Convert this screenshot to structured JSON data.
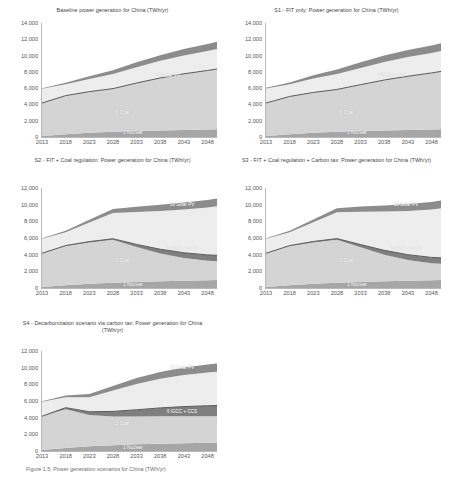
{
  "figure": {
    "caption": "Figure 1.5: Power generation scenarios for China (TWh/yr)",
    "axis": {
      "x_ticks": [
        "2013",
        "2018",
        "2023",
        "2028",
        "2033",
        "2038",
        "2043",
        "2048"
      ],
      "y_ticks_tall": [
        "0",
        "2,000",
        "4,000",
        "6,000",
        "8,000",
        "10,000",
        "12,000",
        "14,000"
      ],
      "y_ticks_short": [
        "0",
        "2,000",
        "4,000",
        "6,000",
        "8,000",
        "10,000",
        "12,000"
      ],
      "ylim_tall": [
        0,
        14000
      ],
      "ylim_short": [
        0,
        12000
      ],
      "xlim": [
        2013,
        2050
      ]
    },
    "colors": {
      "nuclear": "#a6a6a6",
      "coal": "#d4d4d4",
      "igcc_ccs": "#7f7f7f",
      "hydro_other": "#ededed",
      "solar_pv": "#8c8c8c",
      "gridline": "#d9d9d9",
      "text": "#3f3f3f"
    }
  },
  "chart_data": [
    {
      "id": "baseline",
      "type": "area",
      "title": "Baseline power generation for China (TWh/yr)",
      "xlabel": "",
      "ylabel": "",
      "ylim": [
        0,
        14000
      ],
      "grid": false,
      "legend": "in-plot annotations",
      "x": [
        2013,
        2018,
        2023,
        2028,
        2033,
        2038,
        2043,
        2048,
        2050
      ],
      "annotations": [
        "1 Nuclear",
        "3 Coal",
        "19 Solar PV"
      ],
      "series": [
        {
          "name": "1 Nuclear",
          "values": [
            120,
            330,
            520,
            640,
            730,
            800,
            860,
            920,
            950
          ]
        },
        {
          "name": "3 Coal",
          "values": [
            4050,
            4750,
            5050,
            5300,
            5900,
            6450,
            6900,
            7250,
            7400
          ]
        },
        {
          "name": "6 IGCC + CCS",
          "values": [
            0,
            0,
            0,
            0,
            0,
            0,
            0,
            0,
            0
          ]
        },
        {
          "name": "Hydro / other",
          "values": [
            1750,
            1400,
            1550,
            1800,
            1950,
            2100,
            2250,
            2400,
            2450
          ]
        },
        {
          "name": "19 Solar PV",
          "values": [
            60,
            180,
            330,
            470,
            600,
            700,
            790,
            860,
            900
          ]
        }
      ],
      "total_2050": 11400
    },
    {
      "id": "s1",
      "type": "area",
      "title": "S1 - FIT only: Power generation for China (TWh/yr)",
      "xlabel": "",
      "ylabel": "",
      "ylim": [
        0,
        14000
      ],
      "grid": false,
      "x": [
        2013,
        2018,
        2023,
        2028,
        2033,
        2038,
        2043,
        2048,
        2050
      ],
      "annotations": [
        "1 Nuclear",
        "3 Coal",
        "19 Solar PV"
      ],
      "series": [
        {
          "name": "1 Nuclear",
          "values": [
            120,
            330,
            520,
            640,
            730,
            800,
            860,
            920,
            950
          ]
        },
        {
          "name": "3 Coal",
          "values": [
            4050,
            4650,
            4950,
            5200,
            5700,
            6200,
            6600,
            6950,
            7100
          ]
        },
        {
          "name": "6 IGCC + CCS",
          "values": [
            0,
            0,
            0,
            0,
            0,
            0,
            0,
            0,
            0
          ]
        },
        {
          "name": "Hydro / other",
          "values": [
            1800,
            1500,
            1700,
            1900,
            2050,
            2200,
            2350,
            2450,
            2500
          ]
        },
        {
          "name": "19 Solar PV",
          "values": [
            70,
            220,
            400,
            560,
            690,
            800,
            880,
            930,
            960
          ]
        }
      ],
      "total_2050": 11400
    },
    {
      "id": "s2",
      "type": "area",
      "title": "S2 - FIT + Coal regulation: Power generation for China (TWh/yr)",
      "xlabel": "",
      "ylabel": "",
      "ylim": [
        0,
        12000
      ],
      "grid": false,
      "x": [
        2013,
        2018,
        2023,
        2028,
        2033,
        2038,
        2043,
        2048,
        2050
      ],
      "annotations": [
        "1 Nuclear",
        "3 Coal",
        "6 IGCC + CCS",
        "19 Solar PV"
      ],
      "series": [
        {
          "name": "1 Nuclear",
          "values": [
            120,
            330,
            520,
            640,
            730,
            800,
            860,
            920,
            950
          ]
        },
        {
          "name": "3 Coal",
          "values": [
            4050,
            4700,
            4950,
            5150,
            4200,
            3350,
            2750,
            2350,
            2250
          ]
        },
        {
          "name": "6 IGCC + CCS",
          "values": [
            0,
            60,
            100,
            120,
            300,
            500,
            620,
            700,
            720
          ]
        },
        {
          "name": "Hydro / other",
          "values": [
            1750,
            1600,
            2300,
            3100,
            3900,
            4600,
            5200,
            5700,
            5900
          ]
        },
        {
          "name": "19 Solar PV",
          "values": [
            60,
            180,
            330,
            480,
            620,
            730,
            820,
            880,
            910
          ]
        }
      ],
      "total_2050": 10700
    },
    {
      "id": "s3",
      "type": "area",
      "title": "S3 - FIT + Coal regulation + Carbon tax: Power generation for China (TWh/yr)",
      "xlabel": "",
      "ylabel": "",
      "ylim": [
        0,
        12000
      ],
      "grid": false,
      "x": [
        2013,
        2018,
        2023,
        2028,
        2033,
        2038,
        2043,
        2048,
        2050
      ],
      "annotations": [
        "1 Nuclear",
        "3 Coal",
        "6 IGCC + CCS",
        "19 Solar PV"
      ],
      "series": [
        {
          "name": "1 Nuclear",
          "values": [
            120,
            330,
            520,
            640,
            730,
            800,
            860,
            920,
            950
          ]
        },
        {
          "name": "3 Coal",
          "values": [
            4050,
            4700,
            4950,
            5150,
            4150,
            3200,
            2500,
            2050,
            1950
          ]
        },
        {
          "name": "6 IGCC + CCS",
          "values": [
            0,
            60,
            110,
            140,
            330,
            520,
            640,
            700,
            720
          ]
        },
        {
          "name": "Hydro / other",
          "values": [
            1750,
            1600,
            2300,
            3150,
            3950,
            4650,
            5250,
            5750,
            5950
          ]
        },
        {
          "name": "19 Solar PV",
          "values": [
            60,
            180,
            340,
            490,
            630,
            740,
            830,
            890,
            920
          ]
        }
      ],
      "total_2050": 10500
    },
    {
      "id": "s4",
      "type": "area",
      "title": "S4 - Decarbonization scenario via carbon tax: Power generation for China (TWh/yr)",
      "xlabel": "",
      "ylabel": "",
      "ylim": [
        0,
        12000
      ],
      "grid": false,
      "x": [
        2013,
        2018,
        2023,
        2028,
        2033,
        2038,
        2043,
        2048,
        2050
      ],
      "annotations": [
        "1 Nuclear",
        "3 Coal",
        "6 IGCC + CCS",
        "19 Solar PV"
      ],
      "series": [
        {
          "name": "1 Nuclear",
          "values": [
            120,
            350,
            560,
            700,
            800,
            870,
            930,
            980,
            1000
          ]
        },
        {
          "name": "3 Coal",
          "values": [
            4050,
            4650,
            3750,
            3450,
            3350,
            3300,
            3250,
            3200,
            3180
          ]
        },
        {
          "name": "6 IGCC + CCS",
          "values": [
            0,
            200,
            400,
            600,
            800,
            1000,
            1150,
            1250,
            1280
          ]
        },
        {
          "name": "Hydro / other",
          "values": [
            1750,
            1250,
            1750,
            2500,
            3100,
            3500,
            3800,
            4000,
            4050
          ]
        },
        {
          "name": "19 Solar PV",
          "values": [
            60,
            200,
            380,
            550,
            700,
            820,
            900,
            950,
            980
          ]
        }
      ],
      "total_2050": 10500
    }
  ]
}
